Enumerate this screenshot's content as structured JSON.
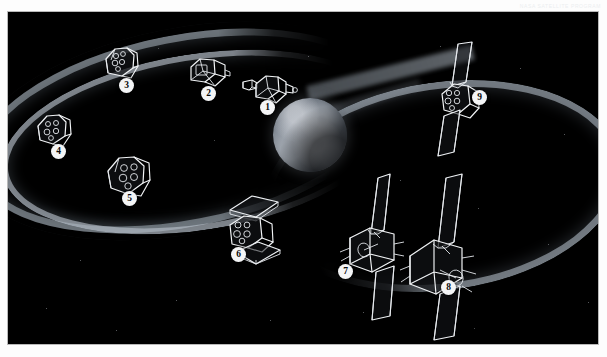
{
  "header": {
    "faint_text": "NASA SATELLITE PROGRAM"
  },
  "figure": {
    "background_color": "#000000",
    "line_color": "#f2f4f6",
    "earth_label": "Earth"
  },
  "callouts": [
    {
      "number": "1",
      "x": 252,
      "y": 88,
      "name": "satellite-1"
    },
    {
      "number": "2",
      "x": 193,
      "y": 74,
      "name": "satellite-2"
    },
    {
      "number": "3",
      "x": 111,
      "y": 66,
      "name": "satellite-3"
    },
    {
      "number": "4",
      "x": 43,
      "y": 132,
      "name": "satellite-4"
    },
    {
      "number": "5",
      "x": 114,
      "y": 179,
      "name": "satellite-5"
    },
    {
      "number": "6",
      "x": 223,
      "y": 235,
      "name": "satellite-6"
    },
    {
      "number": "7",
      "x": 330,
      "y": 252,
      "name": "satellite-7"
    },
    {
      "number": "8",
      "x": 433,
      "y": 268,
      "name": "satellite-8"
    },
    {
      "number": "9",
      "x": 464,
      "y": 78,
      "name": "satellite-9"
    }
  ],
  "stars": [
    {
      "x": 432,
      "y": 34,
      "s": 1.2
    },
    {
      "x": 512,
      "y": 56,
      "s": 1.0
    },
    {
      "x": 556,
      "y": 122,
      "s": 1.1
    },
    {
      "x": 392,
      "y": 168,
      "s": 1.0
    },
    {
      "x": 470,
      "y": 196,
      "s": 1.2
    },
    {
      "x": 540,
      "y": 232,
      "s": 1.0
    },
    {
      "x": 355,
      "y": 300,
      "s": 1.1
    },
    {
      "x": 262,
      "y": 308,
      "s": 1.0
    },
    {
      "x": 168,
      "y": 288,
      "s": 1.1
    },
    {
      "x": 72,
      "y": 248,
      "s": 1.0
    },
    {
      "x": 38,
      "y": 296,
      "s": 1.1
    },
    {
      "x": 206,
      "y": 128,
      "s": 0.9
    },
    {
      "x": 300,
      "y": 44,
      "s": 1.0
    },
    {
      "x": 150,
      "y": 36,
      "s": 0.9
    },
    {
      "x": 592,
      "y": 180,
      "s": 1.0
    },
    {
      "x": 108,
      "y": 318,
      "s": 1.0
    },
    {
      "x": 466,
      "y": 316,
      "s": 0.9
    },
    {
      "x": 580,
      "y": 290,
      "s": 1.0
    }
  ]
}
